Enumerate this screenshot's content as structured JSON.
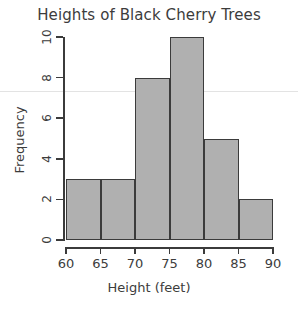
{
  "chart_data": {
    "type": "bar",
    "title": "Heights of Black Cherry Trees",
    "xlabel": "Height (feet)",
    "ylabel": "Frequency",
    "categories": [
      "60-65",
      "65-70",
      "70-75",
      "75-80",
      "80-85",
      "85-90"
    ],
    "bin_edges": [
      60,
      65,
      70,
      75,
      80,
      85,
      90
    ],
    "values": [
      3,
      3,
      8,
      10,
      5,
      2
    ],
    "xlim": [
      60,
      90
    ],
    "ylim": [
      0,
      10
    ],
    "x_ticks": [
      "60",
      "65",
      "70",
      "75",
      "80",
      "85",
      "90"
    ],
    "x_tick_values": [
      60,
      65,
      70,
      75,
      80,
      85,
      90
    ],
    "y_ticks": [
      "0",
      "2",
      "4",
      "6",
      "8",
      "10"
    ],
    "y_tick_values": [
      0,
      2,
      4,
      6,
      8,
      10
    ],
    "grid": false,
    "legend": false,
    "bar_fill_color": "#b0b0b0",
    "bar_border_color": "#3b3b3b",
    "axis_color": "#3b3b3b",
    "text_color": "#3c3c3c",
    "background_color": "#ffffff"
  }
}
